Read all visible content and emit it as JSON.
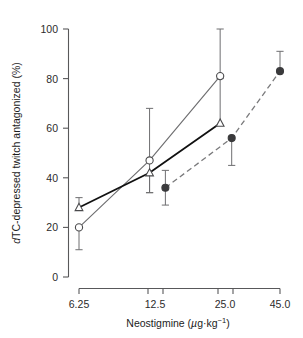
{
  "chart_data": {
    "type": "scatter",
    "title": "",
    "xlabel": "Neostigmine (µg·kg⁻¹)",
    "ylabel": "dTC-depressed twitch antagonized (%)",
    "xscale": "log",
    "xlim": [
      5.6,
      50.5
    ],
    "ylim": [
      0,
      100
    ],
    "xticks": [
      6.25,
      12.5,
      25.0,
      45.0
    ],
    "xticklabels": [
      "6.25",
      "12.5",
      "25.0",
      "45.0"
    ],
    "yticks": [
      0,
      20,
      40,
      60,
      80,
      100
    ],
    "yticklabels": [
      "0",
      "20",
      "40",
      "60",
      "80",
      "100"
    ],
    "grid": false,
    "legend": "none",
    "series": [
      {
        "name": "open-circle-series",
        "marker": "open-circle",
        "linestyle": "solid",
        "color": "#6e6e70",
        "x": [
          6.25,
          12.5,
          25.0
        ],
        "values": [
          20,
          47,
          81
        ],
        "err_low": [
          9,
          13,
          0
        ],
        "err_high": [
          0,
          21,
          19
        ]
      },
      {
        "name": "open-triangle-series",
        "marker": "open-triangle",
        "linestyle": "solid-bold",
        "color": "#111111",
        "x": [
          6.25,
          12.5,
          25.0
        ],
        "values": [
          28,
          42,
          62
        ],
        "err_low": [
          0,
          8,
          0
        ],
        "err_high": [
          4,
          0,
          18
        ]
      },
      {
        "name": "filled-circle-series",
        "marker": "filled-circle",
        "linestyle": "dashed",
        "color": "#3a3a3c",
        "x": [
          14.6,
          28.0,
          45.0
        ],
        "values": [
          36,
          56,
          83
        ],
        "err_low": [
          7,
          11,
          0
        ],
        "err_high": [
          7,
          0,
          8
        ]
      }
    ]
  },
  "axis": {
    "y_label_main": "TC-depressed twitch antagonized (%)",
    "y_label_italic": "d",
    "x_label_main": "Neostigmine (",
    "x_label_unit_mu": "µ",
    "x_label_unit_rest": "g·kg",
    "x_label_exponent": "−1",
    "x_label_close": ")"
  }
}
